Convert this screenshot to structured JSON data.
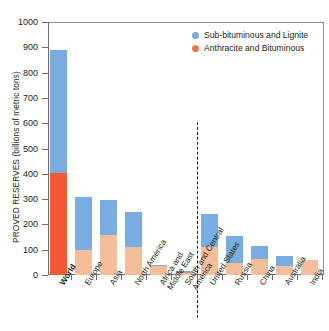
{
  "chart_data": {
    "type": "bar",
    "title": "",
    "subtitle": "",
    "xlabel": "",
    "ylabel": "PROVED RESERVES (billions of metric tons)",
    "ylim": [
      0,
      1000
    ],
    "ytick_values": [
      0,
      100,
      200,
      300,
      400,
      500,
      600,
      700,
      800,
      900,
      1000
    ],
    "ytick_labels": [
      "0",
      "100",
      "200",
      "300",
      "400",
      "500",
      "600",
      "700",
      "800",
      "900",
      "1000"
    ],
    "grid": false,
    "stacked": true,
    "legend_position": "top-right",
    "categories": [
      "World",
      "Europe",
      "Asia",
      "North America",
      "Africa and Middle East",
      "South and Central America",
      "United States",
      "Russia",
      "China",
      "Australia",
      "India"
    ],
    "category_lines": [
      [
        "World"
      ],
      [
        "Europe"
      ],
      [
        "Asia"
      ],
      [
        "North America"
      ],
      [
        "Africa and",
        "Middle East"
      ],
      [
        "South and Central",
        "America"
      ],
      [
        "United States"
      ],
      [
        "Russia"
      ],
      [
        "China"
      ],
      [
        "Australia"
      ],
      [
        "India"
      ]
    ],
    "series": [
      {
        "name": "Anthracite and Bituminous",
        "color": "#F5BE9B",
        "values": [
          404,
          97,
          160,
          112,
          34,
          7,
          111,
          49,
          62,
          37,
          60
        ]
      },
      {
        "name": "Sub-bituminous and Lignite",
        "color": "#79ACE0",
        "values": [
          486,
          213,
          135,
          137,
          4,
          8,
          130,
          107,
          52,
          39,
          0
        ]
      }
    ],
    "totals": [
      890,
      310,
      295,
      249,
      38,
      15,
      241,
      156,
      114,
      76,
      60
    ],
    "annotations": {
      "divider_note": "dashed vertical line separating regions from individual countries"
    },
    "emphasis_bar": "World",
    "emphasis_colors": {
      "bottom": "#F15A33",
      "top": "#79ACE0"
    }
  },
  "legend": {
    "items": [
      {
        "label": "Sub-bituminous and Lignite",
        "color": "#79ACE0"
      },
      {
        "label": "Anthracite and Bituminous",
        "color": "#F1744B"
      }
    ]
  },
  "colors": {
    "blue": "#79ACE0",
    "orange_light": "#F5BE9B",
    "orange_strong": "#F15A33",
    "axis": "#6d6d6d",
    "text": "#231f20"
  }
}
